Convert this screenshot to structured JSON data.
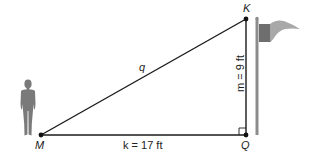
{
  "diagram": {
    "type": "right-triangle word problem",
    "vertices": {
      "M": {
        "label": "M",
        "x": 41,
        "y": 135
      },
      "Q": {
        "label": "Q",
        "x": 246,
        "y": 135
      },
      "K": {
        "label": "K",
        "x": 246,
        "y": 19
      }
    },
    "sides": {
      "hypotenuse": {
        "label": "q",
        "from": "M",
        "to": "K"
      },
      "base": {
        "label": "k = 17 ft",
        "from": "M",
        "to": "Q"
      },
      "height": {
        "label": "m = 9 ft",
        "from": "Q",
        "to": "K"
      }
    },
    "right_angle_at": "Q",
    "figures": {
      "person": "person-silhouette",
      "flagpole": "flagpole-with-flag"
    },
    "colors": {
      "line": "#1a1a1a",
      "silhouette": "#7a7a7a",
      "flag_dark": "#6e6e6e",
      "flag_light": "#a8a8a8",
      "pole": "#8c8c8c"
    }
  }
}
